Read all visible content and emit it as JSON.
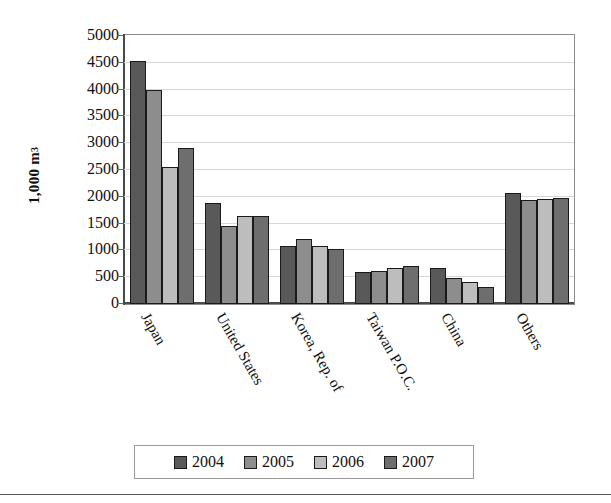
{
  "chart_data": {
    "type": "bar",
    "title": "",
    "xlabel": "",
    "ylabel": "1,000 m",
    "ylabel_superscript": "3",
    "ylim": [
      0,
      5000
    ],
    "ytick_step": 500,
    "yticks": [
      "5000",
      "4500",
      "4000",
      "3500",
      "3000",
      "2500",
      "2000",
      "1500",
      "1000",
      "500",
      "0"
    ],
    "grid": true,
    "legend_position": "bottom",
    "categories": [
      "Japan",
      "United States",
      "Korea, Rep. of",
      "Taiwan P.O.C.",
      "China",
      "Others"
    ],
    "series": [
      {
        "name": "2004",
        "color": "#595959",
        "values": [
          4560,
          1890,
          1090,
          600,
          680,
          2080
        ]
      },
      {
        "name": "2005",
        "color": "#8d8d8d",
        "values": [
          4000,
          1470,
          1210,
          615,
          490,
          1950
        ]
      },
      {
        "name": "2006",
        "color": "#bdbdbd",
        "values": [
          2570,
          1640,
          1080,
          670,
          415,
          1960
        ]
      },
      {
        "name": "2007",
        "color": "#6e6e6e",
        "values": [
          2920,
          1650,
          1030,
          720,
          325,
          1985
        ]
      }
    ]
  },
  "legend": {
    "items": [
      {
        "label": "2004",
        "color": "#595959"
      },
      {
        "label": "2005",
        "color": "#8d8d8d"
      },
      {
        "label": "2006",
        "color": "#bdbdbd"
      },
      {
        "label": "2007",
        "color": "#6e6e6e"
      }
    ]
  }
}
